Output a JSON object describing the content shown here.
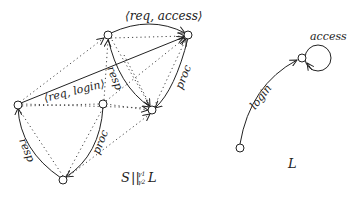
{
  "diagram": {
    "type": "state-machine-composition",
    "left_graph": {
      "caption": "S||γ1γ2 L",
      "caption_main": "S",
      "caption_op": "||",
      "caption_sup": "γ1",
      "caption_sub": "γ2",
      "caption_tail": "L",
      "nodes": [
        "top-left",
        "top-right",
        "left",
        "middle",
        "right-lower",
        "bottom"
      ],
      "edge_labels": {
        "req_access": "⟨req, access⟩",
        "req_login": "⟨req, login⟩",
        "resp_top": "resp",
        "proc_top": "proc",
        "resp_bottom": "resp",
        "proc_bottom": "proc"
      }
    },
    "right_graph": {
      "caption": "L",
      "nodes": [
        "start",
        "logged-in"
      ],
      "edge_labels": {
        "login": "login",
        "access": "access"
      }
    }
  }
}
